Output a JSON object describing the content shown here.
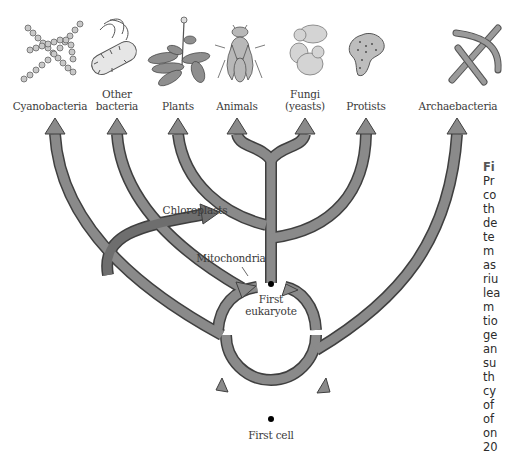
{
  "diagram": {
    "colors": {
      "arrow_fill": "#8a8a8a",
      "arrow_stroke": "#3f3f3f",
      "chloroplast_arrow_fill": "#6e6e6e",
      "text": "#3a3a3a",
      "background": "#ffffff"
    },
    "organisms": [
      {
        "id": "cyanobacteria",
        "label": "Cyanobacteria",
        "icon": "cyanobacteria-icon"
      },
      {
        "id": "other-bacteria",
        "label_line1": "Other",
        "label_line2": "bacteria",
        "icon": "bacterium-icon"
      },
      {
        "id": "plants",
        "label": "Plants",
        "icon": "plant-icon"
      },
      {
        "id": "animals",
        "label": "Animals",
        "icon": "fly-icon"
      },
      {
        "id": "fungi",
        "label_line1": "Fungi",
        "label_line2": "(yeasts)",
        "icon": "yeast-icon"
      },
      {
        "id": "protists",
        "label": "Protists",
        "icon": "amoeba-icon"
      },
      {
        "id": "archaebacteria",
        "label": "Archaebacteria",
        "icon": "archaebacteria-icon"
      }
    ],
    "annotations": {
      "chloroplasts": "Chloroplasts",
      "mitochondria": "Mitochondria",
      "first_eukaryote_line1": "First",
      "first_eukaryote_line2": "eukaryote",
      "first_cell": "First cell"
    },
    "caption_fragments": [
      "Fi",
      "Pr",
      "co",
      "th",
      "de",
      "te",
      "m",
      "as",
      "riu",
      "lea",
      "m",
      "tio",
      "ge",
      "an",
      "su",
      "th",
      "cy",
      "of",
      "of",
      "on",
      "20"
    ]
  }
}
